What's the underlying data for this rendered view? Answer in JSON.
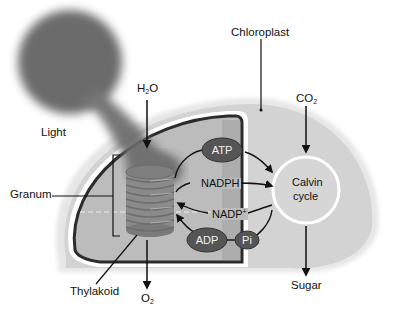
{
  "diagram": {
    "labels": {
      "light": "Light",
      "chloroplast": "Chloroplast",
      "granum": "Granum",
      "thylakoid": "Thylakoid",
      "water": {
        "base": "H",
        "sub": "2",
        "tail": "O"
      },
      "oxygen": {
        "base": "O",
        "sub": "2"
      },
      "carbon_dioxide": {
        "base": "CO",
        "sub": "2"
      },
      "sugar": "Sugar",
      "calvin_line1": "Calvin",
      "calvin_line2": "cycle"
    },
    "molecules": {
      "atp": "ATP",
      "adp": "ADP",
      "pi": "Pi",
      "nadph": "NADPH",
      "nadp": {
        "base": "NADP",
        "sup": "+"
      }
    },
    "colors": {
      "stroma": "#d6d6d6",
      "outer_membrane": "#e4e4e4",
      "inner_compartment": "#bdbdbd",
      "membrane_line": "#2b2b2b",
      "molecule_fill": "#555555",
      "granum_fill": "#8a8a8a",
      "light_glow": "#5a5a5a"
    }
  }
}
